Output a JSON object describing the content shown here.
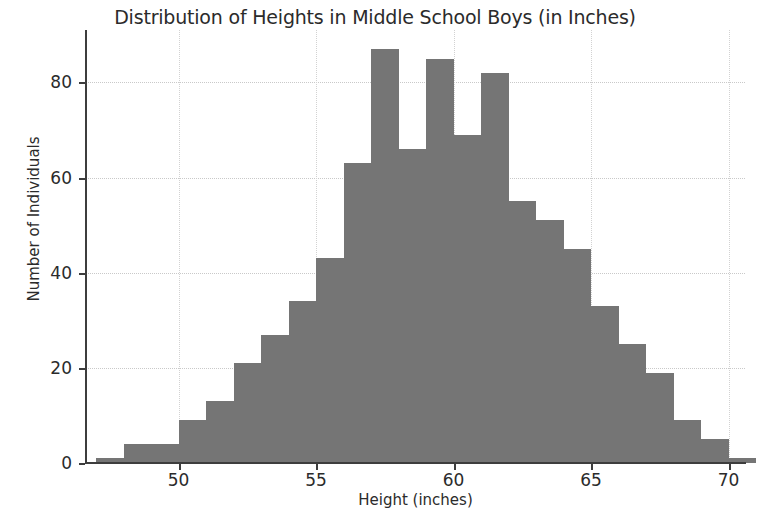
{
  "chart_data": {
    "type": "bar",
    "title": "Distribution of Heights in Middle School Boys (in Inches)",
    "xlabel": "Height (inches)",
    "ylabel": "Number of Individuals",
    "xlim": [
      46.6,
      70.6
    ],
    "ylim": [
      0,
      91
    ],
    "grid": true,
    "legend": null,
    "bar_color": "#757575",
    "bin_width": 1,
    "xticks": [
      50,
      55,
      60,
      65,
      70
    ],
    "xtick_labels": [
      "50",
      "55",
      "60",
      "65",
      "70"
    ],
    "yticks": [
      0,
      20,
      40,
      60,
      80
    ],
    "ytick_labels": [
      "0",
      "20",
      "40",
      "60",
      "80"
    ],
    "bins": [
      47,
      48,
      49,
      50,
      51,
      52,
      53,
      54,
      55,
      56,
      57,
      58,
      59,
      60,
      61,
      62,
      63,
      64,
      65,
      66,
      67,
      68,
      69,
      70
    ],
    "categories": [
      "47-48",
      "48-49",
      "49-50",
      "50-51",
      "51-52",
      "52-53",
      "53-54",
      "54-55",
      "55-56",
      "56-57",
      "57-58",
      "58-59",
      "59-60",
      "60-61",
      "61-62",
      "62-63",
      "63-64",
      "64-65",
      "65-66",
      "66-67",
      "67-68",
      "68-69",
      "69-70",
      "70-70.5"
    ],
    "values": [
      1,
      4,
      4,
      9,
      13,
      21,
      27,
      34,
      43,
      63,
      87,
      66,
      85,
      69,
      82,
      55,
      51,
      45,
      33,
      25,
      19,
      9,
      5,
      1
    ]
  }
}
